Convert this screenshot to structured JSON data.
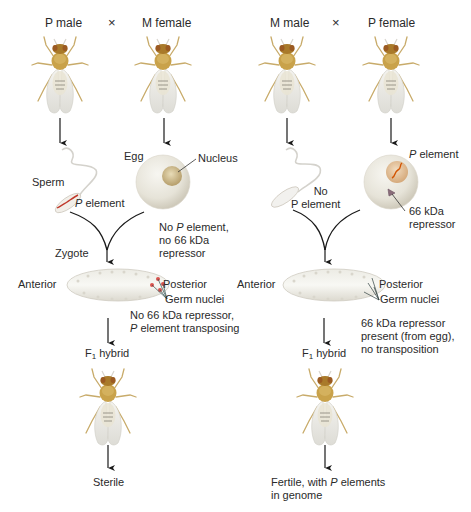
{
  "left_cross": {
    "parent1": "P male",
    "cross_symbol": "×",
    "parent2": "M female",
    "sperm_label": "Sperm",
    "sperm_p_italic": "P",
    "sperm_p_rest": " element",
    "egg_label": "Egg",
    "nucleus_label": "Nucleus",
    "egg_note_line1_pre": "No ",
    "egg_note_line1_italic": "P",
    "egg_note_line1_post": " element,",
    "egg_note_line2": "no 66 kDa",
    "egg_note_line3": "repressor",
    "zygote_label": "Zygote",
    "anterior_label": "Anterior",
    "posterior_label": "Posterior",
    "germ_nuclei_label": "Germ nuclei",
    "zygote_note_line1": "No 66 kDa repressor,",
    "zygote_note_line2_italic": "P",
    "zygote_note_line2_rest": " element transposing",
    "f1_label_main": "F",
    "f1_label_sub": "1",
    "f1_label_rest": " hybrid",
    "outcome": "Sterile"
  },
  "right_cross": {
    "parent1": "M male",
    "cross_symbol": "×",
    "parent2": "P female",
    "sperm_note_line1": "No",
    "sperm_note_line2": "P element",
    "egg_p_italic": "P",
    "egg_p_rest": " element",
    "repressor_line1": "66 kDa",
    "repressor_line2": "repressor",
    "anterior_label": "Anterior",
    "posterior_label": "Posterior",
    "germ_nuclei_label": "Germ nuclei",
    "zygote_note_line1": "66 kDa repressor",
    "zygote_note_line2": "present (from egg),",
    "zygote_note_line3": "no transposition",
    "f1_label_main": "F",
    "f1_label_sub": "1",
    "f1_label_rest": " hybrid",
    "outcome_line1_pre": "Fertile, with ",
    "outcome_line1_italic": "P",
    "outcome_line1_post": " elements",
    "outcome_line2": "in genome"
  },
  "colors": {
    "fly_body": "#c9a24a",
    "fly_head": "#a97a2a",
    "egg": "#e9e6dc",
    "p_element": "#c0392b",
    "repressor": "#8a6d7a"
  }
}
